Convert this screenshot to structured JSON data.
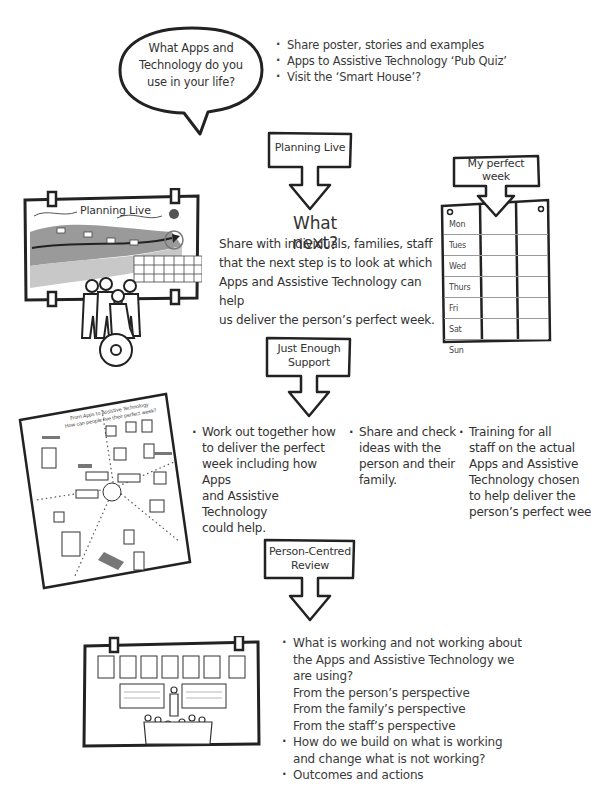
{
  "top": {
    "speech_bubble": {
      "lines": [
        "What Apps and",
        "Technology do you",
        "use in your life?"
      ]
    },
    "bullets": [
      "Share poster, stories and examples",
      "Apps to Assistive Technology ‘Pub Quiz’",
      "Visit the ‘Smart House’?"
    ]
  },
  "steps": [
    {
      "label_lines": [
        "Planning Live"
      ]
    },
    {
      "label_lines": [
        "Just Enough",
        "Support"
      ]
    },
    {
      "label_lines": [
        "Person-Centred",
        "Review"
      ]
    }
  ],
  "planning_live": {
    "illustration_title": "Planning Live",
    "what_next_title": "What next?",
    "what_next_lines": [
      "Share with individuals, families, staff",
      "that the next step is to look at which",
      "Apps and Assistive Technology can help",
      "us deliver the person’s perfect week."
    ]
  },
  "perfect_week": {
    "title_lines": [
      "My perfect",
      "week"
    ],
    "days": [
      "Mon",
      "Tues",
      "Wed",
      "Thurs",
      "Fri",
      "Sat",
      "Sun"
    ]
  },
  "just_enough_support": {
    "columns": [
      {
        "lines": [
          "Work out together how",
          "to deliver the perfect",
          "week including how Apps",
          "and Assistive Technology",
          "could help."
        ]
      },
      {
        "lines": [
          "Share and check",
          "ideas with the",
          "person and their",
          "family."
        ]
      },
      {
        "lines": [
          "Training for all",
          "staff on the actual",
          "Apps and Assistive",
          "Technology chosen",
          "to help deliver the",
          "person’s perfect week."
        ]
      }
    ],
    "poster_title_lines": [
      "From Apps to Assistive Technology",
      "How can people live their perfect week?"
    ]
  },
  "review": {
    "items": [
      {
        "type": "bullet",
        "lines": [
          "What is working and not working about",
          "the Apps and Assistive Technology we",
          "are using?"
        ]
      },
      {
        "type": "plain",
        "lines": [
          "From the person’s perspective"
        ]
      },
      {
        "type": "plain",
        "lines": [
          "From the family’s perspective"
        ]
      },
      {
        "type": "plain",
        "lines": [
          "From the staff’s perspective"
        ]
      },
      {
        "type": "bullet",
        "lines": [
          "How do we build on what is working",
          "and change what is not working?"
        ]
      },
      {
        "type": "bullet",
        "lines": [
          "Outcomes and actions"
        ]
      }
    ]
  },
  "colors": {
    "ink": "#222222",
    "text": "#333333",
    "grey_band": "#9a9a9a",
    "light_band": "#c8c8c8",
    "paper": "#ffffff"
  }
}
